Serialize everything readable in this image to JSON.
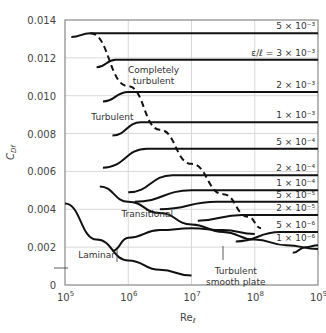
{
  "chart_data": {
    "type": "line",
    "title": "",
    "xlabel": "Re_ℓ",
    "ylabel": "C_Df",
    "xscale": "log",
    "xlim": [
      100000,
      1000000000
    ],
    "ylim": [
      0,
      0.014
    ],
    "grid": true,
    "x_ticks": [
      {
        "exp": 5,
        "label": "10",
        "sup": "5"
      },
      {
        "exp": 6,
        "label": "10",
        "sup": "6"
      },
      {
        "exp": 7,
        "label": "10",
        "sup": "7"
      },
      {
        "exp": 8,
        "label": "10",
        "sup": "8"
      },
      {
        "exp": 9,
        "label": "10",
        "sup": "9"
      }
    ],
    "y_ticks": [
      "0",
      "0.002",
      "0.004",
      "0.006",
      "0.008",
      "0.010",
      "0.012",
      "0.014"
    ],
    "series": [
      {
        "name": "ε/ℓ = 5×10⁻³",
        "label": "5 × 10⁻³",
        "points": [
          [
            5.1,
            0.0131
          ],
          [
            5.4,
            0.0133
          ],
          [
            9,
            0.0133
          ]
        ]
      },
      {
        "name": "ε/ℓ = 3×10⁻³",
        "label": "ε/ℓ = 3 × 10⁻³",
        "points": [
          [
            5.5,
            0.0115
          ],
          [
            5.8,
            0.0119
          ],
          [
            9,
            0.0119
          ]
        ]
      },
      {
        "name": "ε/ℓ = 2×10⁻³",
        "label": "2 × 10⁻³",
        "points": [
          [
            5.6,
            0.0097
          ],
          [
            6.0,
            0.0102
          ],
          [
            9,
            0.0102
          ]
        ]
      },
      {
        "name": "ε/ℓ = 1×10⁻³",
        "label": "1 × 10⁻³",
        "points": [
          [
            5.75,
            0.0079
          ],
          [
            6.2,
            0.0086
          ],
          [
            9,
            0.0086
          ]
        ]
      },
      {
        "name": "ε/ℓ = 5×10⁻⁴",
        "label": "5 × 10⁻⁴",
        "points": [
          [
            5.6,
            0.0062
          ],
          [
            6.3,
            0.0072
          ],
          [
            9,
            0.0072
          ]
        ]
      },
      {
        "name": "ε/ℓ = 2×10⁻⁴",
        "label": "2 × 10⁻⁴",
        "points": [
          [
            6.0,
            0.0049
          ],
          [
            6.7,
            0.0058
          ],
          [
            9,
            0.0058
          ]
        ]
      },
      {
        "name": "ε/ℓ = 1×10⁻⁴",
        "label": "1 × 10⁻⁴",
        "points": [
          [
            6.1,
            0.0044
          ],
          [
            7.0,
            0.005
          ],
          [
            9,
            0.005
          ]
        ]
      },
      {
        "name": "ε/ℓ = 5×10⁻⁵",
        "label": "5 × 10⁻⁵",
        "points": [
          [
            6.5,
            0.004
          ],
          [
            7.4,
            0.0044
          ],
          [
            9,
            0.0044
          ]
        ]
      },
      {
        "name": "ε/ℓ = 2×10⁻⁵",
        "label": "2 × 10⁻⁵",
        "points": [
          [
            7.1,
            0.0034
          ],
          [
            7.8,
            0.0037
          ],
          [
            9,
            0.0037
          ]
        ]
      },
      {
        "name": "ε/ℓ = 5×10⁻⁶",
        "label": "5 × 10⁻⁶",
        "points": [
          [
            7.7,
            0.0023
          ],
          [
            8.4,
            0.0028
          ],
          [
            9,
            0.0028
          ]
        ]
      },
      {
        "name": "ε/ℓ = 1×10⁻⁶",
        "label": "1 × 10⁻⁶",
        "points": [
          [
            8.6,
            0.0017
          ],
          [
            8.8,
            0.002
          ],
          [
            9,
            0.0021
          ]
        ]
      },
      {
        "name": "Turbulent smooth plate",
        "points": [
          [
            5.55,
            0.0052
          ],
          [
            6.0,
            0.0044
          ],
          [
            6.5,
            0.0038
          ],
          [
            7.0,
            0.0032
          ],
          [
            7.5,
            0.0028
          ],
          [
            8.0,
            0.0024
          ],
          [
            8.5,
            0.0021
          ],
          [
            9.0,
            0.0019
          ]
        ]
      },
      {
        "name": "Laminar",
        "points": [
          [
            5.0,
            0.0043
          ],
          [
            5.5,
            0.0024
          ],
          [
            6.0,
            0.0013
          ],
          [
            6.5,
            0.0008
          ],
          [
            7.0,
            0.0005
          ]
        ]
      },
      {
        "name": "Transitional",
        "points": [
          [
            5.75,
            0.0018
          ],
          [
            6.0,
            0.0025
          ],
          [
            6.5,
            0.0029
          ],
          [
            7.0,
            0.003
          ],
          [
            7.5,
            0.0029
          ],
          [
            8.0,
            0.0027
          ]
        ]
      },
      {
        "name": "Completely turbulent boundary (dashed)",
        "style": "dashed",
        "points": [
          [
            5.4,
            0.0133
          ],
          [
            6.0,
            0.0105
          ],
          [
            6.5,
            0.0082
          ],
          [
            7.0,
            0.0064
          ],
          [
            7.5,
            0.0048
          ],
          [
            7.9,
            0.0036
          ],
          [
            8.1,
            0.003
          ]
        ]
      }
    ],
    "annotations": [
      {
        "text": "Completely",
        "x": 6.4,
        "y": 0.0112
      },
      {
        "text": "turbulent",
        "x": 6.4,
        "y": 0.0106
      },
      {
        "text": "Turbulent",
        "x": 5.75,
        "y": 0.0087
      },
      {
        "text": "Transitional",
        "x": 6.3,
        "y": 0.0036
      },
      {
        "text": "Laminar",
        "x": 5.5,
        "y": 0.0014
      },
      {
        "text": "Turbulent",
        "x": 7.7,
        "y": 0.0006
      },
      {
        "text": "smooth plate",
        "x": 7.7,
        "y": 0.0
      }
    ]
  }
}
